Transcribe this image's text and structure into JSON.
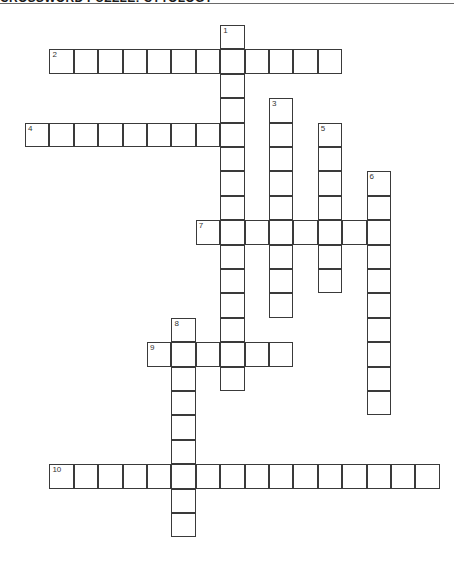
{
  "header": {
    "title": "CROSSWORD PUZZLE: CYTOLOGY"
  },
  "grid": {
    "cell_size": 24.4,
    "origin_x": 25,
    "origin_y": 25,
    "border_color": "#3a3a3a"
  },
  "entries": [
    {
      "number": "1",
      "direction": "down",
      "row": 0,
      "col": 8,
      "length": 15
    },
    {
      "number": "2",
      "direction": "across",
      "row": 1,
      "col": 1,
      "length": 12
    },
    {
      "number": "3",
      "direction": "down",
      "row": 3,
      "col": 10,
      "length": 9
    },
    {
      "number": "4",
      "direction": "across",
      "row": 4,
      "col": 0,
      "length": 9
    },
    {
      "number": "5",
      "direction": "down",
      "row": 4,
      "col": 12,
      "length": 7
    },
    {
      "number": "6",
      "direction": "down",
      "row": 6,
      "col": 14,
      "length": 10
    },
    {
      "number": "7",
      "direction": "across",
      "row": 8,
      "col": 7,
      "length": 8
    },
    {
      "number": "8",
      "direction": "down",
      "row": 12,
      "col": 6,
      "length": 9
    },
    {
      "number": "9",
      "direction": "across",
      "row": 13,
      "col": 5,
      "length": 6
    },
    {
      "number": "10",
      "direction": "across",
      "row": 18,
      "col": 1,
      "length": 16
    }
  ]
}
